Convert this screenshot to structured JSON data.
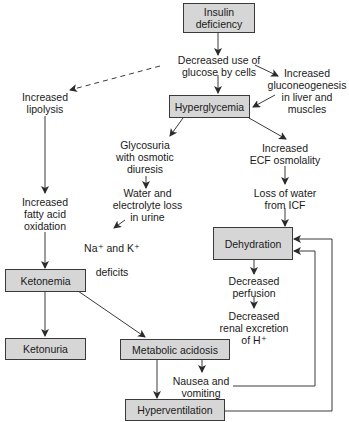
{
  "diagram": {
    "boxes": {
      "insulin_deficiency": "Insulin\ndeficiency",
      "hyperglycemia": "Hyperglycemia",
      "dehydration": "Dehydration",
      "ketonemia": "Ketonemia",
      "ketonuria": "Ketonuria",
      "metabolic_acidosis": "Metabolic acidosis",
      "hyperventilation": "Hyperventilation"
    },
    "labels": {
      "decreased_glucose_use": "Decreased use of\nglucose by cells",
      "increased_gluconeogenesis": "Increased\ngluconeogenesis\nin liver and\nmuscles",
      "increased_lipolysis": "Increased\nlipolysis",
      "glycosuria": "Glycosuria\nwith osmotic\ndiuresis",
      "water_electrolyte_loss": "Water and\nelectrolyte loss\nin urine",
      "na_k_deficits_line1": "Na⁺ and K⁺",
      "na_k_deficits_line2": "deficits",
      "increased_ecf_osmolality": "Increased\nECF osmolality",
      "loss_of_water_icf": "Loss of water\nfrom ICF",
      "increased_fatty_acid_oxidation": "Increased\nfatty acid\noxidation",
      "decreased_perfusion": "Decreased\nperfusion",
      "decreased_renal_excretion": "Decreased\nrenal excretion\nof H⁺",
      "nausea_vomiting": "Nausea and\nvomiting"
    },
    "colors": {
      "box_fill": "#d6d6d6",
      "line": "#3a3a3a"
    }
  }
}
